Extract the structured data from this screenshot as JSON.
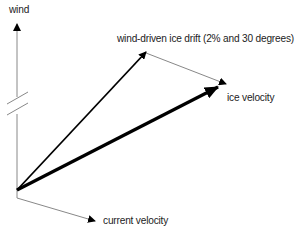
{
  "diagram": {
    "labels": {
      "wind": "wind",
      "wind_drift": "wind-driven ice drift (2% and 30 degrees)",
      "ice_velocity": "ice velocity",
      "current_velocity": "current velocity"
    },
    "vectors": [
      {
        "name": "wind",
        "from": [
          17,
          190
        ],
        "to": [
          17,
          20
        ],
        "style": "thin-gray",
        "axis_break": true
      },
      {
        "name": "wind-driven ice drift",
        "from": [
          17,
          190
        ],
        "to": [
          146,
          52
        ],
        "style": "medium-black"
      },
      {
        "name": "drift-to-ice connector",
        "from": [
          146,
          52
        ],
        "to": [
          226,
          84
        ],
        "style": "thin-gray"
      },
      {
        "name": "ice velocity",
        "from": [
          17,
          190
        ],
        "to": [
          218,
          87
        ],
        "style": "thick-black"
      },
      {
        "name": "current velocity",
        "from": [
          17,
          198
        ],
        "to": [
          95,
          221
        ],
        "style": "thin-gray"
      }
    ],
    "colors": {
      "thin": "#888888",
      "bold": "#000000",
      "text": "#222222"
    }
  }
}
